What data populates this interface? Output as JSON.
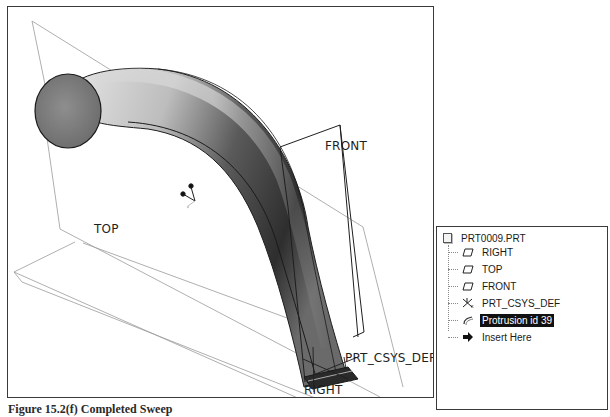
{
  "viewport": {
    "plane_labels": {
      "front": "FRONT",
      "top": "TOP",
      "right": "RIGHT",
      "csys": "PRT_CSYS_DEF"
    }
  },
  "caption": "Figure 15.2(f) Completed Sweep",
  "model_tree": {
    "root": {
      "label": "PRT0009.PRT",
      "icon": "part-icon"
    },
    "items": [
      {
        "label": "RIGHT",
        "icon": "datum-plane-icon",
        "selected": false
      },
      {
        "label": "TOP",
        "icon": "datum-plane-icon",
        "selected": false
      },
      {
        "label": "FRONT",
        "icon": "datum-plane-icon",
        "selected": false
      },
      {
        "label": "PRT_CSYS_DEF",
        "icon": "coordinate-system-icon",
        "selected": false
      },
      {
        "label": "Protrusion id 39",
        "icon": "sweep-protrusion-icon",
        "selected": true
      },
      {
        "label": "Insert Here",
        "icon": "insert-arrow-icon",
        "selected": false
      }
    ]
  },
  "colors": {
    "selection_bg": "#111111",
    "selection_fg": "#ffffff",
    "frame": "#3a3a3a"
  }
}
